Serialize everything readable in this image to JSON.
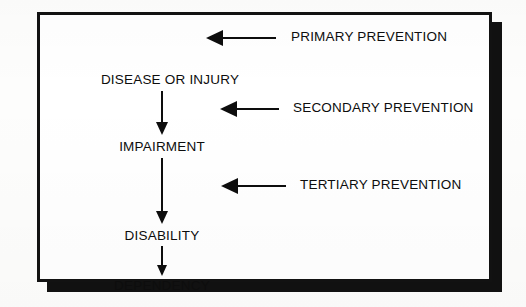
{
  "figure": {
    "colors": {
      "ink": "#0d0d0d",
      "frame": "#121212",
      "shadow": "#111111",
      "paper": "#ffffff",
      "page_background": "#fdfdfc"
    },
    "chain": {
      "title": "Progression chain",
      "nodes": [
        {
          "label": "DISEASE OR INJURY",
          "x": 130,
          "y": 58
        },
        {
          "label": "IMPAIRMENT",
          "x": 122,
          "y": 125
        },
        {
          "label": "DISABILITY",
          "x": 122,
          "y": 214
        },
        {
          "label": "DEPENDENCY",
          "x": 122,
          "y": 264
        }
      ],
      "connectors": [
        {
          "name": "disease-to-impairment",
          "x": 122,
          "y": 76,
          "length": 44
        },
        {
          "name": "impairment-to-disability",
          "x": 122,
          "y": 143,
          "length": 66
        },
        {
          "name": "disability-to-dependency",
          "x": 122,
          "y": 231,
          "length": 30
        }
      ]
    },
    "prevention_arrows": [
      {
        "label": "PRIMARY PREVENTION",
        "name": "primary-prevention",
        "tip_x": 203,
        "y": 14,
        "shaft_length": 70,
        "label_x": 85
      },
      {
        "label": "SECONDARY PREVENTION",
        "name": "secondary-prevention",
        "tip_x": 217,
        "y": 85,
        "shaft_length": 58,
        "label_x": 73
      },
      {
        "label": "TERTIARY PREVENTION",
        "name": "tertiary-prevention",
        "tip_x": 218,
        "y": 162,
        "shaft_length": 64,
        "label_x": 79
      }
    ]
  }
}
